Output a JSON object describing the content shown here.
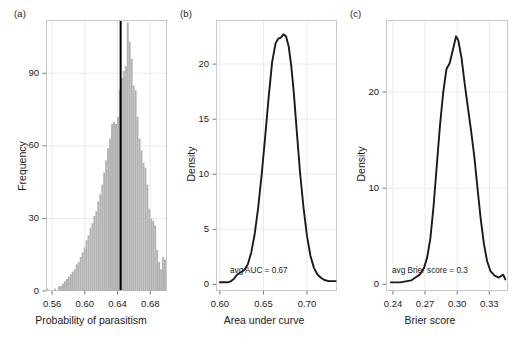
{
  "figure": {
    "background": "#ffffff",
    "panels": [
      "a",
      "b",
      "c"
    ]
  },
  "colors": {
    "hist_fill": "#b3b3b3",
    "hist_edge": "#b3b3b3",
    "vline": "#000000",
    "curve": "#1a1a1a",
    "frame": "#c8c8c8",
    "grid": "#ebebeb",
    "text": "#1a1a1a"
  },
  "panel_a": {
    "tag": "(a)",
    "ylabel": "Frequency",
    "xlabel": "Probability of parasitism",
    "xticks": [
      "0.56",
      "0.60",
      "0.64",
      "0.68"
    ],
    "xtick_values": [
      0.56,
      0.6,
      0.64,
      0.68
    ],
    "yticks": [
      "0",
      "30",
      "60",
      "90"
    ],
    "ytick_values": [
      0,
      30,
      60,
      90
    ]
  },
  "panel_b": {
    "tag": "(b)",
    "ylabel": "Density",
    "xlabel": "Area under curve",
    "xticks": [
      "0.60",
      "0.65",
      "0.70"
    ],
    "xtick_values": [
      0.6,
      0.65,
      0.7
    ],
    "yticks": [
      "0",
      "5",
      "10",
      "15",
      "20"
    ],
    "ytick_values": [
      0,
      5,
      10,
      15,
      20
    ],
    "annotation": "avg AUC = 0.67"
  },
  "panel_c": {
    "tag": "(c)",
    "ylabel": "Density",
    "xlabel": "Brier score",
    "xticks": [
      "0.24",
      "0.27",
      "0.30",
      "0.33"
    ],
    "xtick_values": [
      0.24,
      0.27,
      0.3,
      0.33
    ],
    "yticks": [
      "0",
      "10",
      "20"
    ],
    "ytick_values": [
      0,
      10,
      20
    ],
    "annotation": "avg Brier score = 0.3"
  },
  "chart_data": [
    {
      "type": "bar",
      "panel": "a",
      "title": "",
      "xlabel": "Probability of parasitism",
      "ylabel": "Frequency",
      "xlim": [
        0.5525,
        0.7005
      ],
      "ylim": [
        0,
        112
      ],
      "grid": true,
      "bin_width": 0.0024,
      "bin_centers": [
        0.5541,
        0.5565,
        0.5589,
        0.5613,
        0.5637,
        0.5661,
        0.5685,
        0.5709,
        0.5733,
        0.5757,
        0.5781,
        0.5805,
        0.5829,
        0.5853,
        0.5877,
        0.5901,
        0.5925,
        0.5949,
        0.5973,
        0.5997,
        0.6021,
        0.6045,
        0.6069,
        0.6093,
        0.6117,
        0.6141,
        0.6165,
        0.6189,
        0.6213,
        0.6237,
        0.6261,
        0.6285,
        0.6309,
        0.6333,
        0.6357,
        0.6381,
        0.6405,
        0.6429,
        0.6453,
        0.6477,
        0.6501,
        0.6525,
        0.6549,
        0.6573,
        0.6597,
        0.6621,
        0.6645,
        0.6669,
        0.6693,
        0.6717,
        0.6741,
        0.6765,
        0.6789,
        0.6813,
        0.6837,
        0.6861,
        0.6885,
        0.6909,
        0.6933,
        0.6957,
        0.6981
      ],
      "values": [
        1,
        0,
        0,
        0,
        1,
        0,
        2,
        2,
        3,
        4,
        5,
        6,
        7,
        8,
        9,
        11,
        12,
        14,
        16,
        18,
        21,
        23,
        26,
        28,
        31,
        33,
        37,
        40,
        44,
        49,
        54,
        59,
        63,
        69,
        70,
        69,
        72,
        83,
        88,
        91,
        93,
        111,
        103,
        96,
        85,
        83,
        72,
        63,
        58,
        53,
        51,
        44,
        34,
        30,
        29,
        27,
        17,
        12,
        9,
        14,
        13
      ],
      "vline": {
        "x": 0.6438,
        "label": "mean probability of parasitism",
        "color": "#000000",
        "width": 2
      }
    },
    {
      "type": "line",
      "panel": "b",
      "title": "",
      "xlabel": "Area under curve",
      "ylabel": "Density",
      "xlim": [
        0.5955,
        0.7345
      ],
      "ylim": [
        -0.6,
        24.0
      ],
      "grid": true,
      "annotation": "avg AUC = 0.67",
      "x": [
        0.6,
        0.605,
        0.61,
        0.613,
        0.616,
        0.62,
        0.624,
        0.628,
        0.632,
        0.636,
        0.64,
        0.644,
        0.648,
        0.652,
        0.656,
        0.66,
        0.664,
        0.667,
        0.67,
        0.673,
        0.676,
        0.679,
        0.682,
        0.685,
        0.688,
        0.692,
        0.696,
        0.7,
        0.704,
        0.708,
        0.712,
        0.716,
        0.72,
        0.725,
        0.73,
        0.733
      ],
      "y": [
        0.2,
        0.2,
        0.2,
        0.3,
        0.5,
        0.9,
        1.1,
        1.3,
        1.8,
        2.9,
        4.6,
        7.0,
        10.0,
        13.4,
        17.0,
        20.2,
        21.9,
        22.3,
        22.4,
        22.7,
        22.5,
        21.6,
        19.8,
        17.3,
        14.2,
        10.2,
        7.0,
        4.4,
        2.6,
        1.5,
        0.9,
        0.6,
        0.4,
        0.3,
        0.3,
        0.3
      ]
    },
    {
      "type": "line",
      "panel": "c",
      "title": "",
      "xlabel": "Brier score",
      "ylabel": "Density",
      "xlim": [
        0.2335,
        0.3475
      ],
      "ylim": [
        -0.7,
        27.5
      ],
      "grid": true,
      "annotation": "avg Brier score = 0.3",
      "x": [
        0.238,
        0.242,
        0.247,
        0.252,
        0.257,
        0.261,
        0.265,
        0.269,
        0.272,
        0.275,
        0.278,
        0.281,
        0.284,
        0.287,
        0.29,
        0.293,
        0.296,
        0.299,
        0.301,
        0.304,
        0.307,
        0.31,
        0.313,
        0.316,
        0.319,
        0.322,
        0.325,
        0.328,
        0.331,
        0.335,
        0.339,
        0.343,
        0.345
      ],
      "y": [
        0.2,
        0.2,
        0.2,
        0.3,
        0.4,
        0.7,
        1.0,
        1.7,
        2.8,
        4.8,
        8.2,
        12.4,
        16.6,
        20.0,
        22.4,
        23.0,
        24.4,
        25.8,
        25.4,
        23.6,
        20.9,
        18.4,
        16.0,
        13.3,
        10.0,
        6.8,
        4.2,
        2.4,
        1.4,
        0.9,
        0.7,
        1.0,
        0.5
      ]
    }
  ]
}
